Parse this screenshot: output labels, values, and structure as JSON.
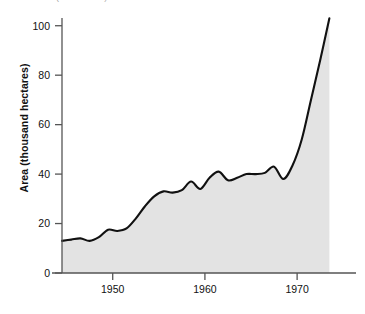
{
  "figure": {
    "clipped_header": "Australia (thousand ha)",
    "ylabel": "Area (thousand hectares)"
  },
  "chart_data": {
    "type": "area",
    "title": "",
    "subtitle": "",
    "xlabel": "",
    "ylabel": "Area (thousand hectares)",
    "xlim": [
      1944.5,
      1974.0
    ],
    "ylim": [
      0,
      110
    ],
    "xticks": [
      1950,
      1960,
      1970
    ],
    "xticklabels": [
      "1950",
      "1960",
      "1970"
    ],
    "yticks": [
      0,
      20,
      40,
      60,
      80,
      100
    ],
    "yticklabels": [
      "0",
      "20",
      "40",
      "60",
      "80",
      "100"
    ],
    "grid": false,
    "legend": null,
    "fill_color": "#e3e3e3",
    "line_color": "#111111",
    "axis_color": "#555555",
    "series": [
      {
        "name": "Area",
        "x": [
          1944.5,
          1945.5,
          1946.5,
          1947.5,
          1948.5,
          1949.5,
          1950.5,
          1951.5,
          1952.5,
          1953.5,
          1954.5,
          1955.5,
          1956.5,
          1957.5,
          1958.5,
          1959.5,
          1960.5,
          1961.5,
          1962.5,
          1963.5,
          1964.5,
          1965.5,
          1966.5,
          1967.5,
          1968.5,
          1969.5,
          1970.5,
          1971.5,
          1972.5,
          1973.5
        ],
        "values": [
          13.0,
          13.5,
          14.0,
          13.0,
          14.5,
          17.5,
          17.0,
          18.0,
          22.0,
          27.0,
          31.0,
          33.0,
          32.5,
          33.5,
          37.0,
          34.0,
          38.5,
          41.0,
          37.5,
          38.5,
          40.0,
          40.0,
          40.5,
          43.0,
          38.0,
          43.5,
          54.0,
          70.0,
          86.0,
          103.0
        ]
      }
    ]
  }
}
